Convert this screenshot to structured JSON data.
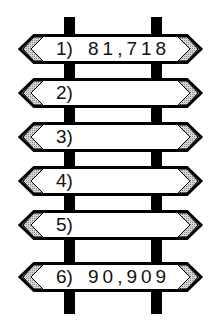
{
  "diagram": {
    "type": "signpost",
    "signs": [
      {
        "label": "1)",
        "value": "81,718"
      },
      {
        "label": "2)",
        "value": ""
      },
      {
        "label": "3)",
        "value": ""
      },
      {
        "label": "4)",
        "value": ""
      },
      {
        "label": "5)",
        "value": ""
      },
      {
        "label": "6)",
        "value": "90,909"
      }
    ],
    "colors": {
      "outline": "#000000",
      "fill": "#ffffff",
      "arrow_hatch": "#bdbdbd"
    }
  }
}
